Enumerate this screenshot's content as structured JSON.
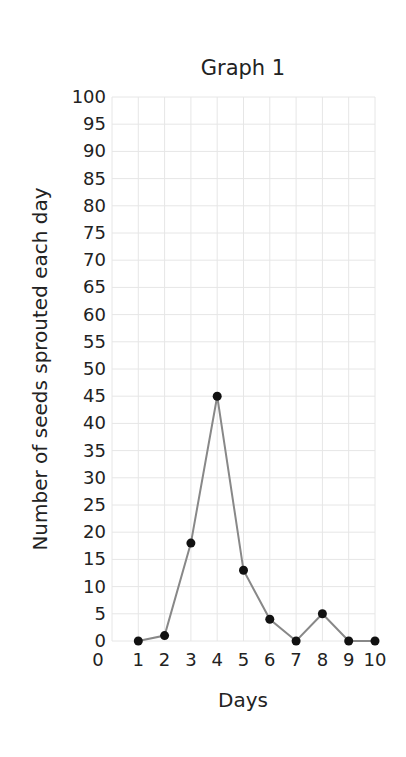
{
  "chart_data": {
    "type": "line",
    "title": "Graph 1",
    "xlabel": "Days",
    "ylabel": "Number of seeds sprouted each day",
    "x": [
      1,
      2,
      3,
      4,
      5,
      6,
      7,
      8,
      9,
      10
    ],
    "values": [
      0,
      1,
      18,
      45,
      13,
      4,
      0,
      5,
      0,
      0
    ],
    "series": [
      {
        "name": "Seeds sprouted",
        "values": [
          0,
          1,
          18,
          45,
          13,
          4,
          0,
          5,
          0,
          0
        ]
      }
    ],
    "xlim": [
      0,
      10
    ],
    "ylim": [
      0,
      100
    ],
    "x_ticks": [
      "0",
      "1",
      "2",
      "3",
      "4",
      "5",
      "6",
      "7",
      "8",
      "9",
      "10"
    ],
    "y_ticks": [
      "0",
      "5",
      "10",
      "15",
      "20",
      "25",
      "30",
      "35",
      "40",
      "45",
      "50",
      "55",
      "60",
      "65",
      "70",
      "75",
      "80",
      "85",
      "90",
      "95",
      "100"
    ],
    "grid": true,
    "legend": "none",
    "line_color": "#888888",
    "marker_color": "#111111",
    "grid_color": "#e6e6e6"
  }
}
